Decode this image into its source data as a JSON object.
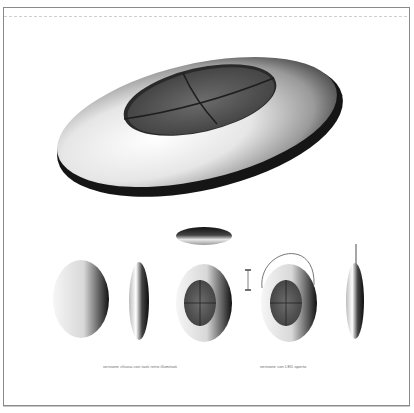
{
  "sheet": {
    "type": "product design render sheet",
    "colors": {
      "frame": "#8a8a8a",
      "body_light": "#f4f4f4",
      "body_shadow": "#1a1a1a",
      "panel": "#5a5a5a",
      "caption": "#6a6a6a"
    }
  },
  "views": {
    "main": "perspective-view",
    "top": "top-edge-view",
    "row": [
      "back-view",
      "side-view",
      "front-view",
      "dimension-marker",
      "front-view-open",
      "side-view-open"
    ]
  },
  "captions": {
    "left": "versione chiusa con tasti retro illuminati",
    "right": "versione con LED aperto"
  }
}
